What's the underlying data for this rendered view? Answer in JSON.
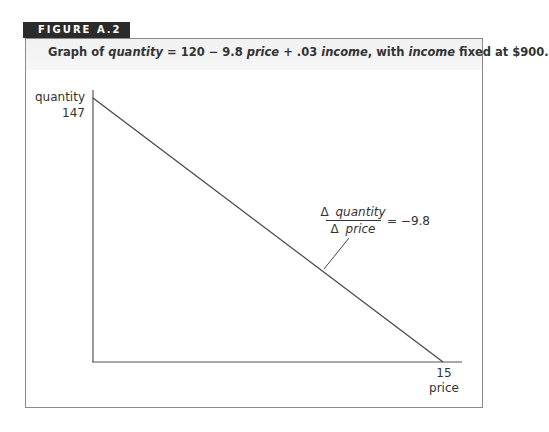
{
  "figure": {
    "label": "FIGURE A.2",
    "caption_parts": [
      {
        "text": "Graph of ",
        "italic": false
      },
      {
        "text": "quantity",
        "italic": true
      },
      {
        "text": " = 120 − 9.8 ",
        "italic": false
      },
      {
        "text": "price",
        "italic": true
      },
      {
        "text": " + .03 ",
        "italic": false
      },
      {
        "text": "income",
        "italic": true
      },
      {
        "text": ", with ",
        "italic": false
      },
      {
        "text": "income",
        "italic": true
      },
      {
        "text": " fixed at $900.",
        "italic": false
      }
    ]
  },
  "chart_data": {
    "type": "line",
    "title": "Graph of quantity = 120 − 9.8 price + .03 income, with income fixed at $900.",
    "xlabel": "price",
    "ylabel": "quantity",
    "x_tick_labels": [
      "15"
    ],
    "y_tick_labels": [
      "147"
    ],
    "series": [
      {
        "name": "quantity",
        "x": [
          0,
          15
        ],
        "values": [
          147,
          0
        ]
      }
    ],
    "xlim": [
      0,
      15
    ],
    "ylim": [
      0,
      147
    ],
    "grid": false,
    "annotations": [
      {
        "numerator": "Δ quantity",
        "denominator": "Δ price",
        "equals": "= −9.8"
      }
    ]
  },
  "labels": {
    "y_axis": "quantity",
    "y_tick": "147",
    "x_tick": "15",
    "x_axis": "price",
    "slope_numerator_delta": "Δ",
    "slope_numerator_var": "quantity",
    "slope_denominator_delta": "Δ",
    "slope_denominator_var": "price",
    "slope_value": "= −9.8"
  },
  "colors": {
    "label_bg": "#2b2b2b",
    "axis": "#555555",
    "line": "#444444",
    "text": "#333333"
  }
}
